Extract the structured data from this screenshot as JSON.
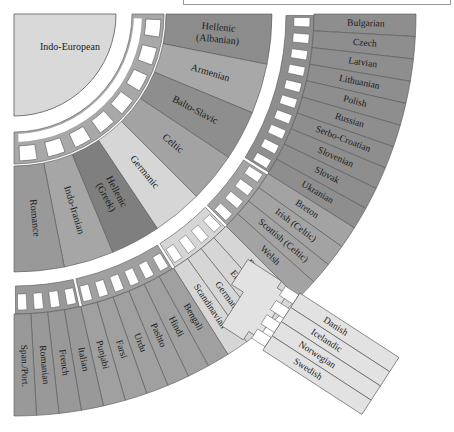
{
  "root": {
    "label": "Indo-European",
    "color": "#d9d9d9"
  },
  "colors": {
    "connector": "#a8a8a8",
    "outline": "#555555",
    "dark": "#8c8c8c",
    "mid": "#a3a3a3",
    "light": "#c4c4c4",
    "pale": "#d8d8d8"
  },
  "branches": [
    {
      "label": "Hellenic",
      "label2": "(Albanian)",
      "color": "#8c8c8c"
    },
    {
      "label": "Armenian",
      "label2": "",
      "color": "#a8a8a8"
    },
    {
      "label": "Balto-Slavic",
      "label2": "",
      "color": "#8e8e8e"
    },
    {
      "label": "Celtic",
      "label2": "",
      "color": "#a3a3a3"
    },
    {
      "label": "Germanic",
      "label2": "",
      "color": "#d6d6d6"
    },
    {
      "label": "Hellenic",
      "label2": "(Greek)",
      "color": "#7f7f7f"
    },
    {
      "label": "Indo-Iranian",
      "label2": "",
      "color": "#a6a6a6"
    },
    {
      "label": "Romance",
      "label2": "",
      "color": "#999999"
    }
  ],
  "leaf_groups": [
    {
      "branch": "Balto-Slavic",
      "color": "#8e8e8e",
      "leaves": [
        "Bulgarian",
        "Czech",
        "Latvian",
        "Lithuanian",
        "Polish",
        "Russian",
        "Serbo-Croatian",
        "Slovenian",
        "Slovak",
        "Ukranian"
      ]
    },
    {
      "branch": "Celtic",
      "color": "#a3a3a3",
      "leaves": [
        "Breton",
        "Irish (Celtic)",
        "Scottish (Celtic)",
        "Welsh"
      ]
    },
    {
      "branch": "Germanic",
      "color": "#d6d6d6",
      "leaves": [
        "Dutch",
        "English",
        "German",
        "Scandinavian"
      ]
    },
    {
      "branch": "Indo-Iranian",
      "color": "#a0a0a0",
      "leaves": [
        "Bengali",
        "Hindi",
        "Pashto",
        "Urdu",
        "Farsi",
        "Punjabi"
      ]
    },
    {
      "branch": "Romance",
      "color": "#999999",
      "leaves": [
        "Italian",
        "French",
        "Romanian",
        "Span./Port."
      ]
    }
  ],
  "scandinavian": {
    "color": "#e2e2e2",
    "leaves": [
      "Danish",
      "Icelandic",
      "Norwegian",
      "Swedish"
    ]
  }
}
